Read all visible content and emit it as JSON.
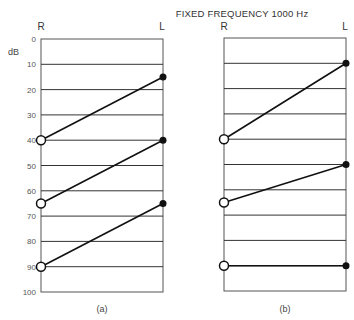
{
  "chart_data": [
    {
      "type": "line",
      "panel": "(a)",
      "title": "FIXED FREQUENCY 1000 Hz",
      "ylabel": "dB",
      "x_categories": [
        "R",
        "L"
      ],
      "ylim": [
        0,
        100
      ],
      "y_inverted": true,
      "yticks": [
        0,
        10,
        20,
        30,
        40,
        50,
        60,
        70,
        80,
        90,
        100
      ],
      "grid": true,
      "series": [
        {
          "name": "pair-1",
          "R": 40,
          "L": 15
        },
        {
          "name": "pair-2",
          "R": 65,
          "L": 40
        },
        {
          "name": "pair-3",
          "R": 90,
          "L": 65
        }
      ],
      "markers": {
        "R": "open-circle",
        "L": "filled-dot"
      }
    },
    {
      "type": "line",
      "panel": "(b)",
      "title": "FIXED FREQUENCY 1000 Hz",
      "ylabel": "dB",
      "x_categories": [
        "R",
        "L"
      ],
      "ylim": [
        0,
        100
      ],
      "y_inverted": true,
      "yticks": [
        0,
        10,
        20,
        30,
        40,
        50,
        60,
        70,
        80,
        90,
        100
      ],
      "grid": true,
      "series": [
        {
          "name": "pair-1",
          "R": 40,
          "L": 10
        },
        {
          "name": "pair-2",
          "R": 65,
          "L": 50
        },
        {
          "name": "pair-3",
          "R": 90,
          "L": 90
        }
      ],
      "markers": {
        "R": "open-circle",
        "L": "filled-dot"
      }
    }
  ],
  "figure": {
    "title": "FIXED FREQUENCY 1000 Hz",
    "ylabel": "dB",
    "ear_left_axis": "R",
    "ear_right_axis": "L",
    "ticks": [
      "0",
      "10",
      "20",
      "30",
      "40",
      "50",
      "60",
      "70",
      "80",
      "90",
      "100"
    ],
    "caption_a": "(a)",
    "caption_b": "(b)"
  }
}
